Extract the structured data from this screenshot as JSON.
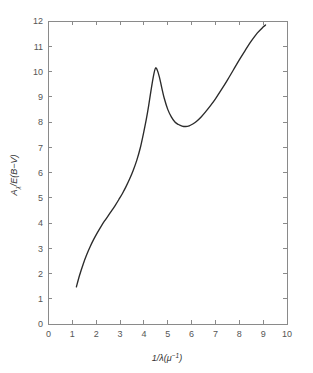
{
  "figure": {
    "background_color": "#ffffff",
    "frame_color": "#8a8a8a",
    "curve_color": "#2b2b2b"
  },
  "chart_data": {
    "type": "line",
    "title": "",
    "xlabel": "1/λ(μ⁻¹)",
    "ylabel": "Aλ/E(B−V)",
    "xlim": [
      0,
      10
    ],
    "ylim": [
      0,
      12
    ],
    "grid": false,
    "legend": "none",
    "xticks": [
      0,
      1,
      2,
      3,
      4,
      5,
      6,
      7,
      8,
      9,
      10
    ],
    "xtick_labels": [
      "0",
      "1",
      "2",
      "3",
      "4",
      "5",
      "6",
      "7",
      "8",
      "9",
      "10"
    ],
    "yticks": [
      0,
      1,
      2,
      3,
      4,
      5,
      6,
      7,
      8,
      9,
      10,
      11,
      12
    ],
    "ytick_labels": [
      "0",
      "1",
      "2",
      "3",
      "4",
      "5",
      "6",
      "7",
      "8",
      "9",
      "10",
      "11",
      "12"
    ],
    "series": [
      {
        "name": "Interstellar extinction curve",
        "x": [
          1.17,
          1.3,
          1.45,
          1.6,
          1.75,
          1.9,
          2.05,
          2.2,
          2.35,
          2.5,
          2.65,
          2.8,
          2.95,
          3.1,
          3.25,
          3.4,
          3.55,
          3.7,
          3.85,
          4.0,
          4.1,
          4.2,
          4.3,
          4.4,
          4.48,
          4.55,
          4.65,
          4.75,
          4.85,
          5.0,
          5.15,
          5.3,
          5.45,
          5.6,
          5.75,
          5.9,
          6.05,
          6.2,
          6.4,
          6.6,
          6.8,
          7.0,
          7.25,
          7.5,
          7.75,
          8.0,
          8.25,
          8.5,
          8.75,
          9.0,
          9.1
        ],
        "y": [
          1.47,
          1.92,
          2.36,
          2.74,
          3.07,
          3.36,
          3.62,
          3.86,
          4.08,
          4.28,
          4.49,
          4.7,
          4.93,
          5.17,
          5.44,
          5.74,
          6.08,
          6.48,
          6.98,
          7.63,
          8.1,
          8.65,
          9.26,
          9.82,
          10.12,
          10.08,
          9.78,
          9.35,
          8.95,
          8.5,
          8.2,
          8.0,
          7.9,
          7.84,
          7.82,
          7.85,
          7.92,
          8.02,
          8.2,
          8.42,
          8.66,
          8.92,
          9.28,
          9.66,
          10.06,
          10.46,
          10.84,
          11.2,
          11.52,
          11.76,
          11.84
        ]
      }
    ],
    "annotations": []
  }
}
